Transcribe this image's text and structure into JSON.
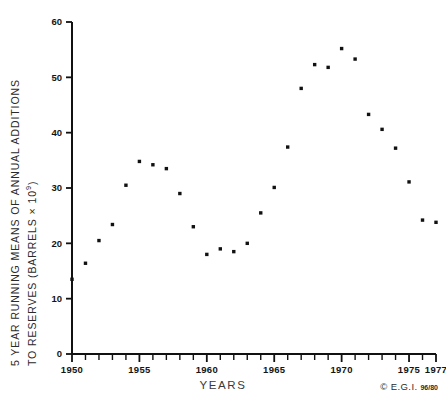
{
  "chart_data": {
    "type": "scatter",
    "title": "",
    "xlabel": "YEARS",
    "ylabel_line1": "5 YEAR RUNNING MEANS OF ANNUAL ADDITIONS",
    "ylabel_line2_prefix": "TO RESERVES (BARRELS × 10",
    "ylabel_line2_sup": "9",
    "ylabel_line2_suffix": ")",
    "xlim": [
      1950,
      1977
    ],
    "ylim": [
      0,
      60
    ],
    "grid": false,
    "legend": "none",
    "xticks_major": [
      1950,
      1955,
      1960,
      1965,
      1970,
      1975,
      1977
    ],
    "xtick_labels": [
      "1950",
      "1955",
      "1960",
      "1965",
      "1970",
      "1975",
      "1977"
    ],
    "xticks_minor_step": 1,
    "yticks": [
      0,
      10,
      20,
      30,
      40,
      50,
      60
    ],
    "ytick_labels": [
      "0",
      "10",
      "20",
      "30",
      "40",
      "50",
      "60"
    ],
    "marker": "square",
    "marker_color": "#111111",
    "marker_size_px": 3.4,
    "x": [
      1950,
      1951,
      1952,
      1953,
      1954,
      1955,
      1956,
      1957,
      1958,
      1959,
      1960,
      1961,
      1962,
      1963,
      1964,
      1965,
      1966,
      1967,
      1968,
      1969,
      1970,
      1971,
      1972,
      1973,
      1974,
      1975,
      1976,
      1977
    ],
    "values": [
      13.5,
      16.4,
      20.5,
      23.4,
      30.5,
      34.8,
      34.2,
      33.5,
      29.0,
      23.0,
      18.0,
      19.0,
      18.5,
      20.0,
      25.5,
      30.1,
      37.4,
      48.0,
      52.3,
      51.8,
      55.2,
      53.3,
      43.3,
      40.6,
      37.2,
      31.1,
      24.2,
      23.8
    ],
    "series": [
      {
        "name": "5 year running means of annual additions to reserves",
        "values": [
          13.5,
          16.4,
          20.5,
          23.4,
          30.5,
          34.8,
          34.2,
          33.5,
          29.0,
          23.0,
          18.0,
          19.0,
          18.5,
          20.0,
          25.5,
          30.1,
          37.4,
          48.0,
          52.3,
          51.8,
          55.2,
          53.3,
          43.3,
          40.6,
          37.2,
          31.1,
          24.2,
          23.8
        ]
      }
    ]
  },
  "footer": {
    "copyright_symbol": "©",
    "copyright_owner": "E.G.I.",
    "copyright_code": "96/80"
  },
  "colors": {
    "axis": "#111111",
    "marker": "#111111",
    "text": "#1b1b1b",
    "background": "#ffffff"
  }
}
